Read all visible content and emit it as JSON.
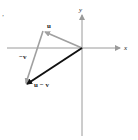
{
  "diagram": {
    "axes": {
      "x_label": "x",
      "y_label": "y"
    },
    "vectors": [
      {
        "name": "u",
        "label": "u",
        "from": "origin",
        "to": "u-tip",
        "color": "#a0a0a0"
      },
      {
        "name": "-v",
        "label": "−v",
        "from": "u-tip",
        "to": "u-v-tip",
        "color": "#a0a0a0"
      },
      {
        "name": "u-v",
        "label": "u − v",
        "from": "origin",
        "to": "u-v-tip",
        "color": "#111111"
      }
    ],
    "corner_mark": "’",
    "colors": {
      "axis": "#9a9a9a",
      "light_vector": "#a0a0a0",
      "result_vector": "#111111",
      "text": "#222222"
    }
  }
}
